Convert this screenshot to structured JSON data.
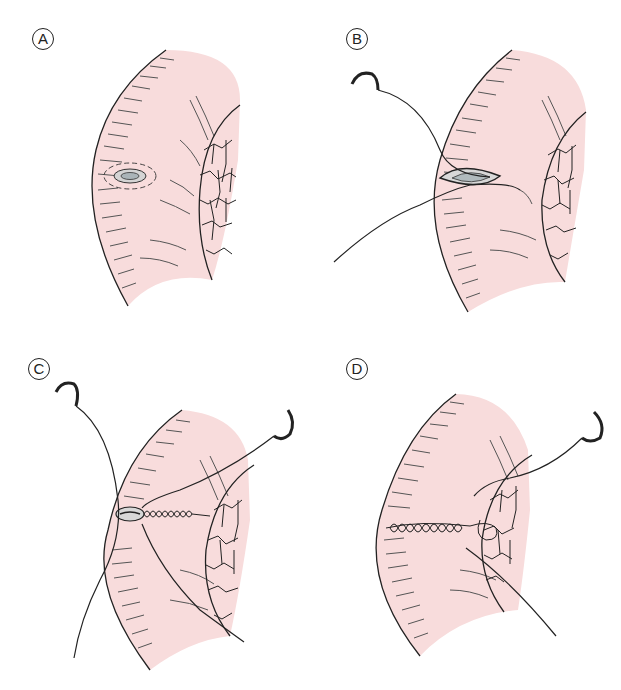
{
  "figure": {
    "colors": {
      "tissue_fill": "#f8dcdc",
      "line": "#222222",
      "hatch": "#555555",
      "defect_fill": "#b8c0c4"
    },
    "panels": [
      {
        "label": "A",
        "description": "Small defect on the serosal surface"
      },
      {
        "label": "B",
        "description": "Needle and suture passed through the margins of the defect"
      },
      {
        "label": "C",
        "description": "Defect closed with running sutures, two needles"
      },
      {
        "label": "D",
        "description": "Completed suture line anchored to adjacent omentum"
      }
    ]
  }
}
